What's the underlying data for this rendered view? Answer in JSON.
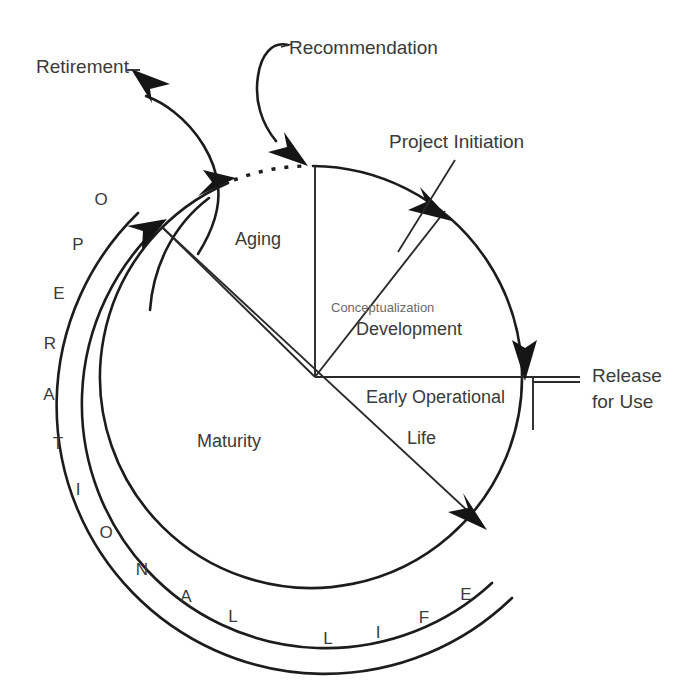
{
  "diagram": {
    "type": "cycle-diagram",
    "center": {
      "x": 315,
      "y": 377
    },
    "radius": 211,
    "colors": {
      "ink": "#1c1c1c",
      "text": "#3a3a3a",
      "faded_text": "#6a6a6a",
      "background": "#ffffff"
    },
    "external_labels": [
      {
        "id": "retirement",
        "text": "Retirement",
        "x": 36,
        "y": 73,
        "anchor": "start"
      },
      {
        "id": "recommendation",
        "text": "Recommendation",
        "x": 289,
        "y": 54,
        "anchor": "start"
      },
      {
        "id": "project-initiation",
        "text": "Project Initiation",
        "x": 389,
        "y": 148,
        "anchor": "start"
      },
      {
        "id": "release-for-use-line1",
        "text": "Release",
        "x": 592,
        "y": 382,
        "anchor": "start"
      },
      {
        "id": "release-for-use-line2",
        "text": "for Use",
        "x": 592,
        "y": 408,
        "anchor": "start"
      }
    ],
    "sector_labels": [
      {
        "id": "aging",
        "text": "Aging",
        "x": 235,
        "y": 245,
        "anchor": "start",
        "size": "main"
      },
      {
        "id": "conceptualization",
        "text": "Conceptualization",
        "x": 331,
        "y": 312,
        "anchor": "start",
        "size": "small"
      },
      {
        "id": "development",
        "text": "Development",
        "x": 356,
        "y": 335,
        "anchor": "start",
        "size": "main"
      },
      {
        "id": "early-operational",
        "text": "Early Operational",
        "x": 366,
        "y": 403,
        "anchor": "start",
        "size": "main"
      },
      {
        "id": "life",
        "text": "Life",
        "x": 407,
        "y": 444,
        "anchor": "start",
        "size": "main"
      },
      {
        "id": "maturity",
        "text": "Maturity",
        "x": 197,
        "y": 447,
        "anchor": "start",
        "size": "main"
      }
    ],
    "ring_word": "OPERATIONAL LIFE",
    "ring_letters": [
      {
        "char": "O",
        "x": 101,
        "y": 205
      },
      {
        "char": "P",
        "x": 78,
        "y": 250
      },
      {
        "char": "E",
        "x": 59,
        "y": 299
      },
      {
        "char": "R",
        "x": 50,
        "y": 349
      },
      {
        "char": "A",
        "x": 49,
        "y": 400
      },
      {
        "char": "T",
        "x": 58,
        "y": 449
      },
      {
        "char": "I",
        "x": 78,
        "y": 495
      },
      {
        "char": "O",
        "x": 106,
        "y": 538
      },
      {
        "char": "N",
        "x": 142,
        "y": 575
      },
      {
        "char": "A",
        "x": 186,
        "y": 602
      },
      {
        "char": "L",
        "x": 233,
        "y": 622
      },
      {
        "char": "L",
        "x": 328,
        "y": 644
      },
      {
        "char": "I",
        "x": 378,
        "y": 638
      },
      {
        "char": "F",
        "x": 424,
        "y": 623
      },
      {
        "char": "E",
        "x": 466,
        "y": 600
      }
    ],
    "arrows": [
      {
        "id": "recommendation-arrow",
        "points_to": "cycle-top",
        "direction": "down"
      },
      {
        "id": "retirement-arrow",
        "points_to": "retirement-label",
        "direction": "up-left"
      },
      {
        "id": "aging-arc-arrow",
        "points_to": "dotted-gap",
        "direction": "up-right"
      },
      {
        "id": "outer-ring-arrow",
        "points_to": "upper-left-ring",
        "direction": "up-right"
      },
      {
        "id": "project-initiation-arrow",
        "points_to": "development-sector",
        "direction": "down-right"
      },
      {
        "id": "release-arrow",
        "points_to": "early-operational",
        "direction": "down"
      },
      {
        "id": "maturity-arrow",
        "points_to": "lower-right-arc",
        "direction": "down-right"
      }
    ],
    "spokes": [
      {
        "id": "spoke-vertical-up",
        "from": "center",
        "angle_deg": 90,
        "label": "aging/conceptualization boundary"
      },
      {
        "id": "spoke-diagonal-ne",
        "from": "center",
        "angle_deg": 52,
        "label": "conceptualization/development boundary"
      },
      {
        "id": "spoke-horizontal-e",
        "from": "center",
        "angle_deg": 0,
        "label": "development/early-operational boundary"
      },
      {
        "id": "spoke-diagonal-sw",
        "from": "center",
        "angle_deg": 225,
        "label": "maturity long diagonal"
      },
      {
        "id": "spoke-diagonal-nw",
        "from": "center",
        "angle_deg": 143,
        "label": "aging/maturity boundary"
      }
    ]
  }
}
